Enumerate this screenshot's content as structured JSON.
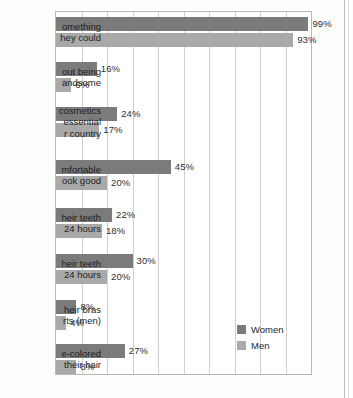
{
  "chart_data": {
    "type": "bar",
    "orientation": "horizontal",
    "title": "",
    "xlabel": "",
    "ylabel": "",
    "xlim": [
      0,
      100
    ],
    "grid": true,
    "grid_step": 10,
    "value_suffix": "%",
    "legend_position": "inside-bottom-right",
    "categories": [
      "omething\nhey could",
      "out being\nandsome",
      "cosmetics\nessential\nr country",
      "mfortable\nook good",
      "heir teeth\n24 hours",
      "heir teeth\n24 hours",
      "heir bras\nrts (men)",
      "e-colored\ntheir hair"
    ],
    "category_lines": [
      [
        "omething",
        "hey could"
      ],
      [
        "out being",
        "andsome"
      ],
      [
        "cosmetics",
        "essential",
        "r country"
      ],
      [
        "mfortable",
        "ook good"
      ],
      [
        "heir teeth",
        "24 hours"
      ],
      [
        "heir teeth",
        "24 hours"
      ],
      [
        "heir bras",
        "rts (men)"
      ],
      [
        "e-colored",
        "their hair"
      ]
    ],
    "series": [
      {
        "name": "Women",
        "color": "#7b7b7b",
        "values": [
          99,
          16,
          24,
          45,
          22,
          30,
          8,
          27
        ],
        "labels": [
          "99%",
          "16%",
          "24%",
          "45%",
          "22%",
          "30%",
          "8%",
          "27%"
        ]
      },
      {
        "name": "Men",
        "color": "#a9a9a9",
        "values": [
          93,
          6,
          17,
          20,
          18,
          20,
          4,
          8
        ],
        "labels": [
          "93%",
          "6%",
          "17%",
          "20%",
          "18%",
          "20%",
          "4%",
          "8%"
        ]
      }
    ]
  },
  "legend": {
    "items": [
      {
        "label": "Women",
        "color": "#7b7b7b"
      },
      {
        "label": "Men",
        "color": "#a9a9a9"
      }
    ]
  },
  "colors": {
    "women": "#7b7b7b",
    "men": "#a9a9a9",
    "gridline": "#cfcfcf",
    "border": "#b9b9b9",
    "text": "#1d1d1d",
    "background": "#ffffff"
  }
}
